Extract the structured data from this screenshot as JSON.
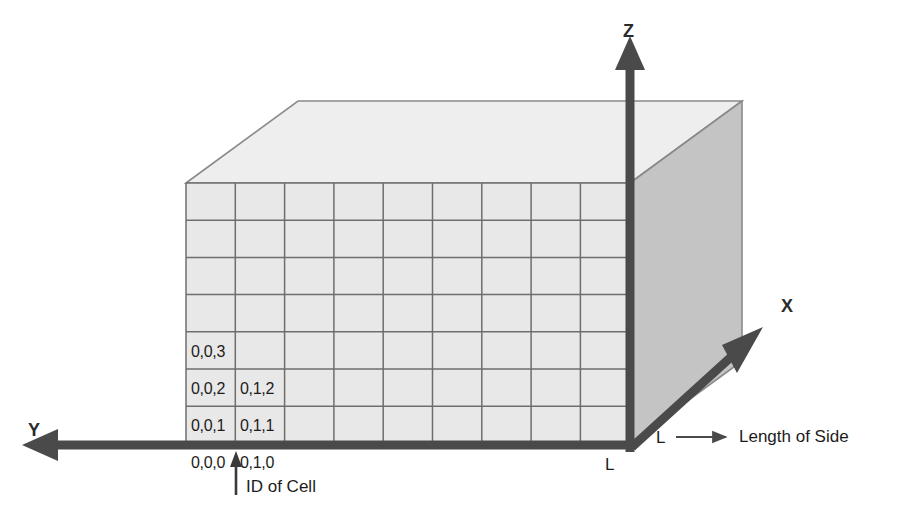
{
  "figure": {
    "kind": "3d-grid-cube-diagram",
    "colors": {
      "front_face": "#e8e8e8",
      "top_face": "#eeeeee",
      "side_face": "#c4c4c4",
      "grid_line": "#6e6e6e",
      "outline": "#7a7a7a",
      "axis": "#4a4a4a",
      "text": "#1c1c1c",
      "background": "#ffffff"
    },
    "grid": {
      "columns": 9,
      "rows": 7,
      "left": 186,
      "top": 183,
      "cell_width": 49.3,
      "cell_height": 37.2
    },
    "depth": {
      "dx": 112,
      "dy": -82
    }
  },
  "axes": [
    {
      "name": "z-axis",
      "label": "Z",
      "direction": "up"
    },
    {
      "name": "x-axis",
      "label": "X",
      "direction": "up-right"
    },
    {
      "name": "y-axis",
      "label": "Y",
      "direction": "left"
    }
  ],
  "cells": [
    {
      "label": "0,0,3",
      "col": 0,
      "row_from_bottom": 3
    },
    {
      "label": "0,0,2",
      "col": 0,
      "row_from_bottom": 2
    },
    {
      "label": "0,1,2",
      "col": 1,
      "row_from_bottom": 2
    },
    {
      "label": "0,0,1",
      "col": 0,
      "row_from_bottom": 1
    },
    {
      "label": "0,1,1",
      "col": 1,
      "row_from_bottom": 1
    },
    {
      "label": "0,0,0",
      "col": 0,
      "row_from_bottom": 0
    },
    {
      "label": "0,1,0",
      "col": 1,
      "row_from_bottom": 0
    }
  ],
  "annotations": {
    "id_of_cell": "ID of Cell",
    "side_bottom": "L",
    "side_right": "L",
    "legend_symbol": "L",
    "legend_text": "Length of Side"
  }
}
